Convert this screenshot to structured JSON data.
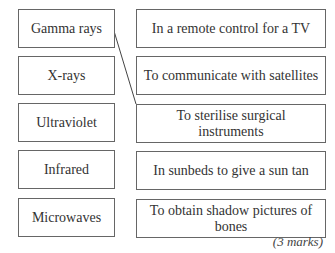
{
  "left_boxes": [
    {
      "label": "Gamma rays"
    },
    {
      "label": "X-rays"
    },
    {
      "label": "Ultraviolet"
    },
    {
      "label": "Infrared"
    },
    {
      "label": "Microwaves"
    }
  ],
  "right_boxes": [
    {
      "label": "In a remote control for a TV"
    },
    {
      "label": "To communicate with satellites"
    },
    {
      "label": "To sterilise surgical instruments"
    },
    {
      "label": "In sunbeds to give a sun tan"
    },
    {
      "label": "To obtain shadow pictures of bones"
    }
  ],
  "connections": [
    {
      "from": "Gamma rays",
      "to": "To sterilise surgical instruments"
    }
  ],
  "marks": "(3 marks)"
}
